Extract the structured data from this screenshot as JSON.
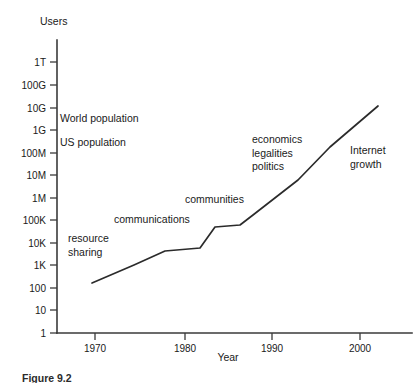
{
  "figure": {
    "caption": "Figure 9.2",
    "background_color": "#ffffff",
    "line_color": "#2b2b2b",
    "axis_color": "#3a3a3a",
    "text_color": "#1a1a1a"
  },
  "chart_data": {
    "type": "line",
    "title": "",
    "subtitle": "",
    "xlabel": "Year",
    "ylabel": "Users",
    "grid": false,
    "legend_position": "none",
    "yscale": "log",
    "xlim": [
      1966,
      2004
    ],
    "ylim": [
      1,
      1000000000000
    ],
    "xticks": [
      1970,
      1980,
      1990,
      2000
    ],
    "xtick_labels": [
      "1970",
      "1980",
      "1990",
      "2000"
    ],
    "yticks": [
      1,
      10,
      100,
      1000,
      10000,
      100000,
      1000000,
      10000000,
      100000000,
      1000000000,
      10000000000,
      100000000000,
      1000000000000
    ],
    "ytick_labels": [
      "1",
      "10",
      "100",
      "1K",
      "10K",
      "100K",
      "1M",
      "10M",
      "100M",
      "1G",
      "10G",
      "100G",
      "1T"
    ],
    "series": [
      {
        "name": "Internet users",
        "x": [
          1969.0,
          1976.5,
          1981.5,
          1983.0,
          1984.0,
          1987.0,
          1988.5,
          1992.5,
          1996.0,
          2002.0
        ],
        "y": [
          180,
          1200,
          3200,
          4200,
          12000,
          17000,
          30000,
          900000,
          60000000,
          7000000000
        ]
      }
    ],
    "annotations": [
      {
        "id": "world-population",
        "text": "World population",
        "x": 1969.5,
        "y": 3000000000
      },
      {
        "id": "us-population",
        "text": "US population",
        "x": 1969.5,
        "y": 280000000
      },
      {
        "id": "resource-sharing-line1",
        "text": "resource",
        "x": 1970.4,
        "y": 20000
      },
      {
        "id": "resource-sharing-line2",
        "text": "sharing",
        "x": 1970.4,
        "y": 8000
      },
      {
        "id": "communications",
        "text": "communications",
        "x": 1975.5,
        "y": 140000
      },
      {
        "id": "communities",
        "text": "communities",
        "x": 1982.8,
        "y": 2200000
      },
      {
        "id": "economics",
        "text": "economics",
        "x": 1990.0,
        "y": 300000000
      },
      {
        "id": "legalities",
        "text": "legalities",
        "x": 1990.0,
        "y": 110000000
      },
      {
        "id": "politics",
        "text": "politics",
        "x": 1990.0,
        "y": 40000000
      },
      {
        "id": "internet-growth-line1",
        "text": "Internet",
        "x": 1999.8,
        "y": 130000000
      },
      {
        "id": "internet-growth-line2",
        "text": "growth",
        "x": 1999.8,
        "y": 48000000
      }
    ]
  },
  "geometry": {
    "plot_left": 57,
    "plot_right": 412,
    "plot_top": 40,
    "plot_bottom": 333,
    "ytick_y": [
      333,
      310,
      288,
      265,
      243,
      220,
      198,
      175,
      153,
      130,
      108,
      85,
      62
    ],
    "xtick_x": [
      95,
      185,
      272,
      360
    ],
    "series_points": [
      [
        92,
        283
      ],
      [
        134,
        265
      ],
      [
        165,
        251
      ],
      [
        200,
        248
      ],
      [
        215,
        227
      ],
      [
        240,
        225
      ],
      [
        253,
        215
      ],
      [
        298,
        180
      ],
      [
        330,
        147
      ],
      [
        378,
        106
      ]
    ],
    "ylabel_pos": [
      40,
      25
    ],
    "xlabel_pos": [
      228,
      361
    ],
    "annotation_pos": [
      [
        60,
        122
      ],
      [
        60,
        146
      ],
      [
        68,
        242
      ],
      [
        68,
        256
      ],
      [
        114,
        223
      ],
      [
        185,
        203
      ],
      [
        252,
        143
      ],
      [
        252,
        157
      ],
      [
        252,
        170
      ],
      [
        350,
        154
      ],
      [
        350,
        168
      ]
    ]
  }
}
